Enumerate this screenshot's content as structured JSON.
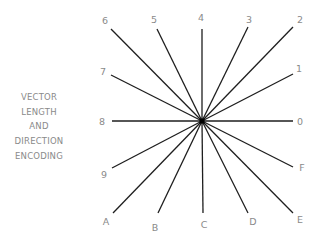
{
  "title": {
    "lines": [
      "VECTOR",
      "LENGTH",
      "AND",
      "DIRECTION",
      "ENCODING"
    ]
  },
  "diagram": {
    "center": [
      202,
      121
    ],
    "vectors": [
      {
        "code": "0",
        "end": [
          293,
          121
        ],
        "label_pos": [
          300,
          122
        ]
      },
      {
        "code": "1",
        "end": [
          293,
          74
        ],
        "label_pos": [
          299,
          69
        ]
      },
      {
        "code": "2",
        "end": [
          293,
          27
        ],
        "label_pos": [
          300,
          20
        ]
      },
      {
        "code": "3",
        "end": [
          248,
          27
        ],
        "label_pos": [
          249,
          20
        ]
      },
      {
        "code": "4",
        "end": [
          202,
          29
        ],
        "label_pos": [
          201,
          18
        ]
      },
      {
        "code": "5",
        "end": [
          157,
          29
        ],
        "label_pos": [
          154,
          20
        ]
      },
      {
        "code": "6",
        "end": [
          111,
          29
        ],
        "label_pos": [
          105,
          21
        ]
      },
      {
        "code": "7",
        "end": [
          111,
          75
        ],
        "label_pos": [
          103,
          72
        ]
      },
      {
        "code": "8",
        "end": [
          112,
          121
        ],
        "label_pos": [
          102,
          122
        ]
      },
      {
        "code": "9",
        "end": [
          112,
          168
        ],
        "label_pos": [
          104,
          175
        ]
      },
      {
        "code": "A",
        "end": [
          113,
          213
        ],
        "label_pos": [
          106,
          222
        ]
      },
      {
        "code": "B",
        "end": [
          158,
          213
        ],
        "label_pos": [
          155,
          228
        ]
      },
      {
        "code": "C",
        "end": [
          203,
          213
        ],
        "label_pos": [
          204,
          225
        ]
      },
      {
        "code": "D",
        "end": [
          248,
          213
        ],
        "label_pos": [
          253,
          222
        ]
      },
      {
        "code": "E",
        "end": [
          293,
          213
        ],
        "label_pos": [
          300,
          220
        ]
      },
      {
        "code": "F",
        "end": [
          293,
          167
        ],
        "label_pos": [
          302,
          168
        ]
      }
    ]
  }
}
